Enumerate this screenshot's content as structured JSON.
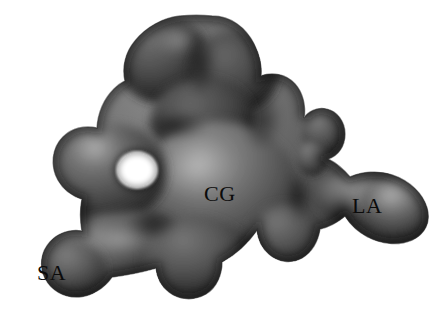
{
  "figure": {
    "kind": "3d-shaded-isosurface-rendering",
    "background_color": "#ffffff",
    "surface_base_color": "#5a5a5a",
    "surface_shadow_color": "#1b1b1b",
    "surface_highlight_color": "#8d8d8d",
    "label_color": "#0b0b0b",
    "canvas": {
      "width": 442,
      "height": 321
    }
  },
  "labels": [
    {
      "id": "cg",
      "text": "CG",
      "x": 204,
      "y": 183,
      "name": "central-globule-label"
    },
    {
      "id": "la",
      "text": "LA",
      "x": 352,
      "y": 195,
      "name": "large-arm-label"
    },
    {
      "id": "sa",
      "text": "SA",
      "x": 37,
      "y": 262,
      "name": "small-arm-label"
    }
  ],
  "features": {
    "through_hole": {
      "present": true,
      "cx": 137,
      "cy": 170,
      "rx": 20,
      "ry": 18,
      "color": "#ffffff"
    },
    "upper_left_lobe": {
      "present": true
    },
    "upper_right_lobe": {
      "present": true
    },
    "small_right_protrusion": {
      "present": true
    },
    "lower_left_arm": {
      "present": true
    },
    "right_arm": {
      "present": true
    }
  }
}
